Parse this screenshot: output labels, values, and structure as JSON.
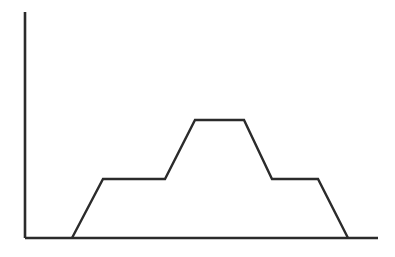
{
  "page": {
    "background_color": "#ffffff",
    "width": 395,
    "height": 257
  },
  "chart_data": {
    "type": "line",
    "title": "",
    "subtitle": "",
    "xlabel": "",
    "ylabel": "",
    "legend": [],
    "legend_position": "none",
    "grid": false,
    "axes": {
      "x_axis_visible": true,
      "y_axis_visible": true,
      "x_axis_tick_labels": [],
      "y_axis_tick_labels": [],
      "xlim": [
        0,
        100
      ],
      "ylim": [
        0,
        100
      ],
      "axis_color": "#2b2b2b",
      "axis_line_width": 2.6,
      "origin_px": {
        "x": 25,
        "y": 238
      },
      "x_axis_end_px": {
        "x": 378,
        "y": 238
      },
      "y_axis_end_px": {
        "x": 25,
        "y": 12
      }
    },
    "series": [
      {
        "name": "profile",
        "color": "#2b2b2b",
        "line_width": 2.4,
        "points_px": [
          {
            "x": 72,
            "y": 238
          },
          {
            "x": 103,
            "y": 179
          },
          {
            "x": 165,
            "y": 179
          },
          {
            "x": 195,
            "y": 120
          },
          {
            "x": 244,
            "y": 120
          },
          {
            "x": 272,
            "y": 179
          },
          {
            "x": 318,
            "y": 179
          },
          {
            "x": 348,
            "y": 238
          }
        ],
        "x": [
          13.3,
          22.1,
          39.7,
          48.2,
          62.0,
          70.0,
          83.0,
          91.5
        ],
        "values": [
          0,
          26.1,
          26.1,
          52.2,
          52.2,
          26.1,
          26.1,
          0
        ]
      }
    ],
    "annotations": []
  }
}
